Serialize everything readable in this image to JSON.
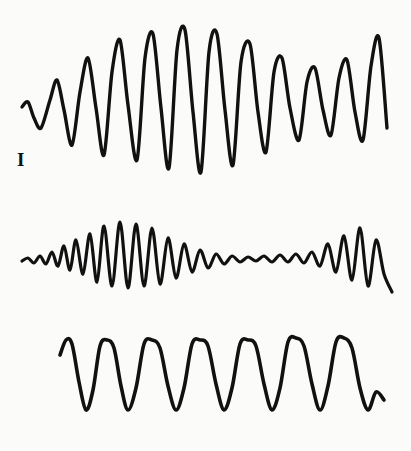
{
  "figure": {
    "kind": "waveform-trace-figure",
    "background_color": "#fbfbfa",
    "ink_color": "#111111",
    "width": 411,
    "height": 451,
    "trace_count": 3
  },
  "traces": [
    {
      "label": "I",
      "label_name": "roman-numeral-one",
      "description": "Oscillation that grows from small amplitude, peaks mid-record, then decays to a steady moderate amplitude",
      "cycles": 14,
      "baseline_y": 105,
      "stroke_width": 3.4
    },
    {
      "label": "II",
      "label_name": "roman-numeral-two",
      "description": "Oscillation starting with tiny ripples, swelling to a large amplitude burst, decaying to near-flat ripples, then a single large late spike",
      "cycles": 18,
      "baseline_y": 62,
      "stroke_width": 3.2
    },
    {
      "label": "III",
      "label_name": "roman-numeral-three",
      "description": "Nearly uniform sustained oscillation of constant amplitude and period across the whole record",
      "cycles": 11,
      "baseline_y": 57,
      "stroke_width": 3.6
    }
  ],
  "chart_data": {
    "type": "line",
    "title": "",
    "xlabel": "",
    "ylabel": "",
    "grid": false,
    "legend": "none",
    "series": [
      {
        "name": "I",
        "x": [
          22,
          28,
          34,
          41,
          50,
          57,
          64,
          72,
          80,
          88,
          96,
          104,
          112,
          120,
          128,
          137,
          145,
          153,
          161,
          169,
          177,
          185,
          193,
          201,
          209,
          217,
          225,
          233,
          241,
          250,
          258,
          266,
          274,
          282,
          290,
          299,
          307,
          315,
          323,
          331,
          339,
          347,
          355,
          363,
          371,
          379,
          387
        ],
        "y": [
          107,
          102,
          118,
          128,
          100,
          80,
          110,
          145,
          92,
          58,
          108,
          155,
          72,
          40,
          105,
          160,
          58,
          34,
          108,
          168,
          50,
          30,
          112,
          172,
          52,
          34,
          110,
          165,
          62,
          44,
          112,
          152,
          72,
          58,
          108,
          140,
          82,
          68,
          110,
          135,
          78,
          60,
          112,
          140,
          66,
          38,
          128
        ],
        "ylim": [
          28,
          178
        ],
        "xlim": [
          22,
          390
        ]
      },
      {
        "name": "II",
        "x": [
          22,
          28,
          34,
          40,
          46,
          52,
          58,
          64,
          70,
          76,
          83,
          90,
          97,
          104,
          112,
          120,
          128,
          136,
          144,
          152,
          160,
          168,
          176,
          184,
          192,
          200,
          208,
          216,
          224,
          232,
          240,
          248,
          256,
          264,
          272,
          280,
          288,
          296,
          304,
          312,
          320,
          328,
          336,
          344,
          352,
          360,
          368,
          376,
          384,
          392
        ],
        "y": [
          61,
          58,
          63,
          56,
          64,
          52,
          66,
          46,
          70,
          40,
          74,
          34,
          82,
          26,
          86,
          22,
          88,
          24,
          86,
          28,
          84,
          38,
          78,
          44,
          72,
          50,
          68,
          54,
          64,
          56,
          62,
          57,
          61,
          56,
          62,
          55,
          62,
          54,
          63,
          52,
          66,
          44,
          72,
          36,
          80,
          28,
          86,
          40,
          74,
          92
        ],
        "ylim": [
          22,
          92
        ],
        "xlim": [
          22,
          395
        ]
      },
      {
        "name": "III",
        "x": [
          60,
          66,
          72,
          79,
          86,
          93,
          100,
          107,
          114,
          121,
          128,
          136,
          144,
          152,
          160,
          168,
          176,
          184,
          192,
          200,
          208,
          216,
          224,
          232,
          240,
          248,
          256,
          264,
          272,
          280,
          288,
          296,
          304,
          312,
          320,
          328,
          336,
          344,
          352,
          360,
          368,
          376,
          384
        ],
        "y": [
          35,
          20,
          24,
          62,
          90,
          70,
          26,
          20,
          28,
          66,
          90,
          68,
          24,
          20,
          28,
          66,
          90,
          68,
          24,
          20,
          26,
          64,
          90,
          68,
          24,
          20,
          26,
          64,
          90,
          68,
          22,
          18,
          26,
          64,
          90,
          66,
          22,
          18,
          28,
          68,
          90,
          72,
          80
        ],
        "ylim": [
          18,
          92
        ],
        "xlim": [
          60,
          388
        ]
      }
    ]
  }
}
